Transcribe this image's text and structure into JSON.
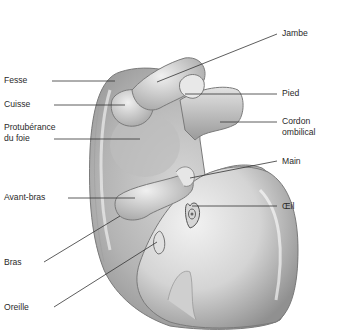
{
  "diagram": {
    "colors": {
      "background": "#ffffff",
      "skin_light": "#eeeeee",
      "skin_mid": "#bdbdbd",
      "skin_dark": "#8a8a8a",
      "outline": "#7a7a7a",
      "leader_line": "#333333",
      "text": "#2a2a2a"
    },
    "labels_left": [
      {
        "id": "fesse",
        "text": "Fesse"
      },
      {
        "id": "cuisse",
        "text": "Cuisse"
      },
      {
        "id": "foie_1",
        "text": "Protubérance"
      },
      {
        "id": "foie_2",
        "text": "du foie"
      },
      {
        "id": "avant_bras",
        "text": "Avant-bras"
      },
      {
        "id": "bras",
        "text": "Bras"
      },
      {
        "id": "oreille",
        "text": "Oreille"
      }
    ],
    "labels_right": [
      {
        "id": "jambe",
        "text": "Jambe"
      },
      {
        "id": "pied",
        "text": "Pied"
      },
      {
        "id": "cordon_1",
        "text": "Cordon"
      },
      {
        "id": "cordon_2",
        "text": "ombilical"
      },
      {
        "id": "main",
        "text": "Main"
      },
      {
        "id": "oeil",
        "text": "Œil"
      }
    ]
  }
}
